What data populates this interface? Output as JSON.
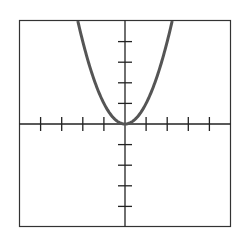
{
  "chart_data": {
    "type": "line",
    "title": "",
    "xlabel": "",
    "ylabel": "",
    "function": "y = x^2",
    "xlim": [
      -5,
      5
    ],
    "ylim": [
      -5,
      5
    ],
    "x_ticks": [
      -4,
      -3,
      -2,
      -1,
      1,
      2,
      3,
      4
    ],
    "y_ticks": [
      -4,
      -3,
      -2,
      -1,
      1,
      2,
      3,
      4
    ],
    "grid": false,
    "legend": false,
    "series": [
      {
        "name": "y = x^2",
        "x": [
          -2.24,
          -2,
          -1.5,
          -1,
          -0.5,
          0,
          0.5,
          1,
          1.5,
          2,
          2.24
        ],
        "y": [
          5,
          4,
          2.25,
          1,
          0.25,
          0,
          0.25,
          1,
          2.25,
          4,
          5
        ]
      }
    ],
    "colors": {
      "frame": "#333333",
      "axes": "#222222",
      "curve": "#555555",
      "background": "#ffffff"
    }
  }
}
